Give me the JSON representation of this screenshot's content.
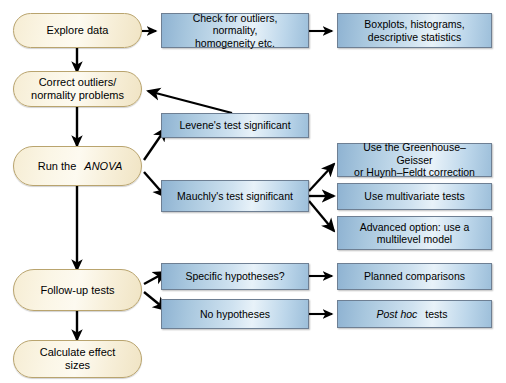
{
  "diagram": {
    "colors": {
      "box_fill_light": "#e8f2f9",
      "box_fill_mid": "#a8c7de",
      "box_fill_dark": "#8fb3d2",
      "box_border": "#6e7f93",
      "oval_fill_light": "#fdfaf0",
      "oval_fill_dark": "#f0e4c4",
      "oval_border": "#b9a46e",
      "arrow_color": "#000000",
      "background": "#ffffff"
    }
  },
  "nodes": {
    "explore_data": {
      "label": "Explore data",
      "shape": "oval"
    },
    "correct_outliers": {
      "line1": "Correct outliers/",
      "line2": "normality problems",
      "shape": "oval"
    },
    "run_anova": {
      "prefix": "Run the ",
      "emphasis": "ANOVA",
      "shape": "oval"
    },
    "follow_up_tests": {
      "label": "Follow-up tests",
      "shape": "oval"
    },
    "calculate_effect_sizes": {
      "line1": "Calculate effect",
      "line2": "sizes",
      "shape": "oval"
    },
    "check_assumptions": {
      "line1": "Check for outliers, normality,",
      "line2": "homogeneity etc.",
      "shape": "box"
    },
    "boxplots": {
      "line1": "Boxplots, histograms,",
      "line2": "descriptive statistics",
      "shape": "box"
    },
    "levene": {
      "label": "Levene's test significant",
      "shape": "box"
    },
    "mauchly": {
      "label": "Mauchly's test significant",
      "shape": "box"
    },
    "greenhouse": {
      "line1": "Use the Greenhouse–Geisser",
      "line2": "or Huynh–Feldt correction",
      "shape": "box"
    },
    "multivariate": {
      "label": "Use multivariate tests",
      "shape": "box"
    },
    "multilevel": {
      "line1": "Advanced option: use a",
      "line2": "multilevel model",
      "shape": "box"
    },
    "specific_hypotheses": {
      "label": "Specific hypotheses?",
      "shape": "box"
    },
    "no_hypotheses": {
      "label": "No hypotheses",
      "shape": "box"
    },
    "planned_comparisons": {
      "label": "Planned comparisons",
      "shape": "box"
    },
    "post_hoc": {
      "emphasis": "Post hoc",
      "suffix": " tests",
      "shape": "box"
    }
  },
  "edges": [
    {
      "from": "explore_data",
      "to": "check_assumptions",
      "kind": "horizontal"
    },
    {
      "from": "check_assumptions",
      "to": "boxplots",
      "kind": "horizontal"
    },
    {
      "from": "explore_data",
      "to": "correct_outliers",
      "kind": "vertical"
    },
    {
      "from": "correct_outliers",
      "to": "run_anova",
      "kind": "vertical"
    },
    {
      "from": "levene",
      "to": "correct_outliers",
      "kind": "diagonal-back"
    },
    {
      "from": "run_anova",
      "to": "levene",
      "kind": "diagonal-up"
    },
    {
      "from": "run_anova",
      "to": "mauchly",
      "kind": "diagonal-down"
    },
    {
      "from": "mauchly",
      "to": "greenhouse",
      "kind": "diagonal-up"
    },
    {
      "from": "mauchly",
      "to": "multivariate",
      "kind": "horizontal"
    },
    {
      "from": "mauchly",
      "to": "multilevel",
      "kind": "diagonal-down"
    },
    {
      "from": "run_anova",
      "to": "follow_up_tests",
      "kind": "vertical"
    },
    {
      "from": "follow_up_tests",
      "to": "specific_hypotheses",
      "kind": "diagonal-up"
    },
    {
      "from": "follow_up_tests",
      "to": "no_hypotheses",
      "kind": "diagonal-down"
    },
    {
      "from": "specific_hypotheses",
      "to": "planned_comparisons",
      "kind": "horizontal"
    },
    {
      "from": "no_hypotheses",
      "to": "post_hoc",
      "kind": "horizontal"
    },
    {
      "from": "follow_up_tests",
      "to": "calculate_effect_sizes",
      "kind": "vertical"
    }
  ]
}
